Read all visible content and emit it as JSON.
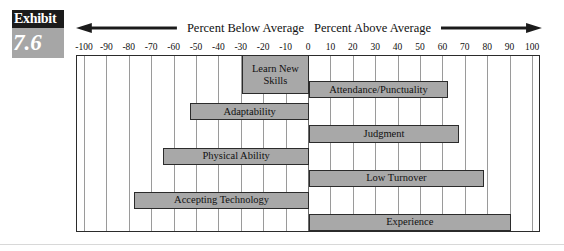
{
  "exhibit": {
    "word": "Exhibit",
    "number": "7.6"
  },
  "header": {
    "left_caption": "Percent Below Average",
    "right_caption": "Percent Above Average",
    "left_arrow_icon": "arrow-left-icon",
    "right_arrow_icon": "arrow-right-icon"
  },
  "chart_data": {
    "type": "bar",
    "orientation": "horizontal",
    "title": "",
    "xlabel": "",
    "ylabel": "",
    "xlim": [
      -100,
      100
    ],
    "grid": true,
    "legend": false,
    "tick_labels": [
      "-100",
      "-90",
      "-80",
      "-70",
      "-60",
      "-50",
      "-40",
      "-30",
      "-20",
      "-10",
      "0",
      "10",
      "20",
      "30",
      "40",
      "50",
      "60",
      "70",
      "80",
      "90",
      "100"
    ],
    "ticks": [
      -100,
      -90,
      -80,
      -70,
      -60,
      -50,
      -40,
      -30,
      -20,
      -10,
      0,
      10,
      20,
      30,
      40,
      50,
      60,
      70,
      80,
      90,
      100
    ],
    "categories": [
      "Learn New\nSkills",
      "Attendance/Punctuality",
      "Adaptability",
      "Judgment",
      "Physical Ability",
      "Low Turnover",
      "Judgment-spacer",
      "Accepting Technology",
      "Experience"
    ],
    "bars": [
      {
        "label": "Learn New\nSkills",
        "start": -30,
        "end": 0,
        "value": -30,
        "row": 0
      },
      {
        "label": "Attendance/Punctuality",
        "start": 0,
        "end": 62,
        "value": 62,
        "row": 1
      },
      {
        "label": "Adaptability",
        "start": -53,
        "end": 0,
        "value": -53,
        "row": 2
      },
      {
        "label": "Judgment",
        "start": 0,
        "end": 67,
        "value": 67,
        "row": 3
      },
      {
        "label": "Physical Ability",
        "start": -65,
        "end": 0,
        "value": -65,
        "row": 4
      },
      {
        "label": "Low Turnover",
        "start": 0,
        "end": 78,
        "value": 78,
        "row": 5
      },
      {
        "label": "Accepting Technology",
        "start": -78,
        "end": 0,
        "value": -78,
        "row": 6
      },
      {
        "label": "Experience",
        "start": 0,
        "end": 90,
        "value": 90,
        "row": 7
      }
    ],
    "colors": {
      "bar_fill": "#a8a8a8",
      "bar_border": "#2b2b2b",
      "gridline": "#9a9a9a",
      "frame": "#2b2b2b",
      "background": "#ffffff",
      "badge_dark": "#1b1b1b",
      "badge_gray": "#a6a6a6"
    }
  }
}
